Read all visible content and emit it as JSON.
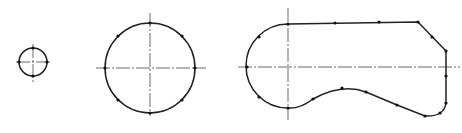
{
  "caption_fragment": "",
  "colors": {
    "stroke": "#222222",
    "axis": "#444444",
    "point": "#111111",
    "background": "#ffffff"
  },
  "figures": [
    {
      "id": "small-circle",
      "type": "circle",
      "center": [
        33,
        62
      ],
      "radius": 14,
      "axes": {
        "h": [
          16,
          50
        ],
        "v": [
          44,
          82
        ]
      },
      "points": [
        [
          33,
          48
        ],
        [
          47,
          62
        ],
        [
          33,
          76
        ],
        [
          19,
          62
        ]
      ]
    },
    {
      "id": "large-circle",
      "type": "circle",
      "center": [
        150,
        68
      ],
      "radius": 45,
      "axes": {
        "h": [
          96,
          206
        ],
        "v": [
          13,
          116
        ]
      },
      "points": [
        [
          150,
          23
        ],
        [
          182,
          36
        ],
        [
          195,
          68
        ],
        [
          182,
          100
        ],
        [
          150,
          113
        ],
        [
          118,
          100
        ],
        [
          105,
          68
        ],
        [
          118,
          36
        ]
      ]
    },
    {
      "id": "cam-profile",
      "type": "closed-curve",
      "path": "M288,24 L418,22 L446,51 L446,103 Q444,117 425,116 L397,105 L366,92 Q342,83 313,99 Q300,109 288,108 A42,42 0 0 1 288,24 Z",
      "axes": {
        "h": [
          238,
          460,
          67
        ],
        "v": [
          288,
          8,
          120
        ]
      },
      "points": [
        [
          288,
          24
        ],
        [
          335,
          23
        ],
        [
          379,
          22
        ],
        [
          418,
          22
        ],
        [
          432,
          37
        ],
        [
          446,
          51
        ],
        [
          446,
          76
        ],
        [
          446,
          103
        ],
        [
          440,
          113
        ],
        [
          425,
          116
        ],
        [
          397,
          105
        ],
        [
          366,
          92
        ],
        [
          342,
          88
        ],
        [
          313,
          99
        ],
        [
          288,
          108
        ],
        [
          259,
          97
        ],
        [
          247,
          67
        ],
        [
          259,
          37
        ]
      ]
    }
  ]
}
